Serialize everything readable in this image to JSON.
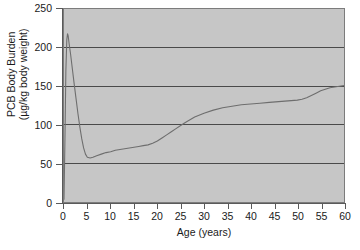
{
  "chart_data": {
    "type": "line",
    "title": "",
    "xlabel": "Age (years)",
    "ylabel": "PCB Body Burden (µg/kg body weight)",
    "ylabel_line1": "PCB Body Burden",
    "ylabel_line2": "(µg/kg body weight)",
    "xlim": [
      0,
      60
    ],
    "ylim": [
      0,
      250
    ],
    "xticks": [
      0,
      5,
      10,
      15,
      20,
      25,
      30,
      35,
      40,
      45,
      50,
      55,
      60
    ],
    "yticks": [
      0,
      50,
      100,
      150,
      200,
      250
    ],
    "xtick_labels": [
      "0",
      "5",
      "10",
      "15",
      "20",
      "25",
      "30",
      "35",
      "40",
      "45",
      "50",
      "55",
      "60"
    ],
    "ytick_labels": [
      "0",
      "50",
      "100",
      "150",
      "200",
      "250"
    ],
    "gridlines_y": [
      50,
      100,
      150,
      200
    ],
    "grid": true,
    "legend": "none",
    "plot_background": "#c6c6c6",
    "line_color": "#6e6e6e",
    "series": [
      {
        "name": "PCB body burden",
        "x": [
          0.0,
          0.2,
          0.4,
          0.6,
          0.75,
          0.9,
          1.1,
          1.4,
          1.8,
          2.2,
          2.6,
          3.0,
          3.4,
          3.8,
          4.2,
          4.6,
          5.0,
          5.6,
          6.2,
          7.0,
          8.0,
          9.0,
          10.0,
          11.0,
          12.0,
          13.0,
          14.0,
          15.0,
          16.0,
          17.0,
          18.0,
          19.0,
          20.0,
          21.0,
          22.0,
          23.0,
          24.0,
          25.0,
          26.0,
          28.0,
          30.0,
          32.0,
          34.0,
          36.0,
          38.0,
          40.0,
          42.0,
          44.0,
          46.0,
          48.0,
          50.0,
          51.0,
          52.0,
          53.0,
          54.0,
          55.0,
          56.0,
          57.0,
          58.0,
          59.0,
          60.0
        ],
        "y": [
          3,
          80,
          170,
          210,
          218,
          215,
          205,
          192,
          172,
          152,
          133,
          114,
          97,
          82,
          70,
          62,
          58,
          57,
          58,
          60,
          62,
          64,
          65,
          67,
          68,
          69,
          70,
          71,
          72,
          73,
          74,
          76,
          79,
          83,
          87,
          91,
          95,
          99,
          103,
          110,
          115,
          119,
          122,
          124,
          126,
          127,
          128,
          129,
          130,
          131,
          132,
          133,
          135,
          138,
          141,
          144,
          146,
          148,
          149,
          150,
          151
        ]
      }
    ]
  }
}
